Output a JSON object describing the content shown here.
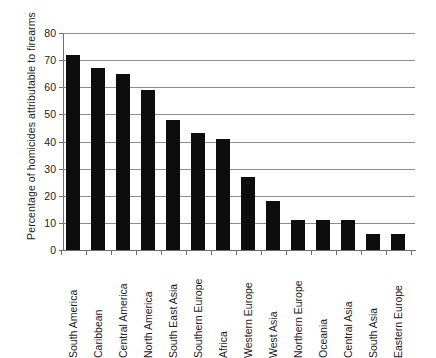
{
  "chart_data": {
    "type": "bar",
    "title": "",
    "subtitle": "",
    "xlabel": "",
    "ylabel": "Percentage of homicides attributable to firearms",
    "ylim": [
      0,
      80
    ],
    "yticks": [
      0,
      10,
      20,
      30,
      40,
      50,
      60,
      70,
      80
    ],
    "grid": "horizontal",
    "legend": "none",
    "bar_color": "#0d0d0d",
    "gridline_color": "#8c8c8c",
    "axis_color": "#6d6d6d",
    "categories": [
      "South America",
      "Caribbean",
      "Central America",
      "North America",
      "South East Asia",
      "Southern Europe",
      "Africa",
      "Western Europe",
      "West Asia",
      "Northern Europe",
      "Oceania",
      "Central Asia",
      "South Asia",
      "Eastern Europe"
    ],
    "values": [
      72,
      67,
      65,
      59,
      48,
      43,
      41,
      27,
      18,
      11,
      11,
      11,
      6,
      6
    ]
  }
}
